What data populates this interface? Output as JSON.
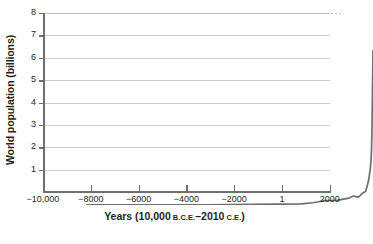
{
  "chart_data": {
    "type": "line",
    "title": "",
    "xlabel_parts": {
      "main_prefix": "Years (10,000 ",
      "era_start": "B.C.E.",
      "dash": "–",
      "main_mid": "2010 ",
      "era_end": "C.E.",
      "main_suffix": ")"
    },
    "xlabel": "Years (10,000 B.C.E.–2010 C.E.)",
    "ylabel": "World population (billions)",
    "xlim": [
      -10000,
      2010
    ],
    "ylim": [
      0,
      8
    ],
    "grid": true,
    "legend": "none",
    "line_color": "#6d6e71",
    "grid_color": "#c9cacc",
    "axis_color": "#6d6e71",
    "background": "#ffffff",
    "xticks": [
      -10000,
      -8000,
      -6000,
      -4000,
      -2000,
      1,
      2000
    ],
    "xtick_labels": [
      "−10,000",
      "−8000",
      "−6000",
      "−4000",
      "−2000",
      "1",
      "2000"
    ],
    "yticks": [
      1,
      2,
      3,
      4,
      5,
      6,
      7,
      8
    ],
    "ytick_labels": [
      "1",
      "2",
      "3",
      "4",
      "5",
      "6",
      "7",
      "8"
    ],
    "series": [
      {
        "name": "World population",
        "x": [
          -10000,
          -8000,
          -6000,
          -5000,
          -4000,
          -3000,
          -2000,
          -1000,
          -500,
          1,
          500,
          1000,
          1200,
          1400,
          1500,
          1600,
          1700,
          1750,
          1800,
          1850,
          1900,
          1927,
          1950,
          1960,
          1970,
          1980,
          1990,
          1999,
          2010
        ],
        "y": [
          0.004,
          0.005,
          0.007,
          0.01,
          0.015,
          0.025,
          0.035,
          0.05,
          0.1,
          0.2,
          0.21,
          0.31,
          0.4,
          0.35,
          0.45,
          0.55,
          0.6,
          0.79,
          0.98,
          1.26,
          1.65,
          2.0,
          2.53,
          3.03,
          3.7,
          4.45,
          5.31,
          6.0,
          6.9
        ]
      }
    ],
    "peak_value": 6.9,
    "peak_year": 2010
  }
}
